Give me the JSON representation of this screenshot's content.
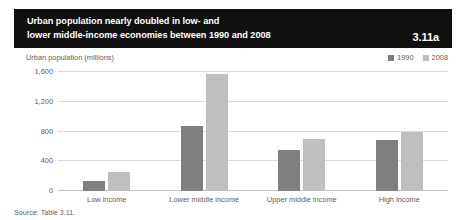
{
  "top_clip": {
    "left_fragment": "",
    "right_fragment": ""
  },
  "banner": {
    "title": "Urban population nearly doubled in low- and\nlower middle-income economies between 1990 and 2008",
    "figure_number": "3.11a",
    "background_color": "#101010",
    "text_color": "#ffffff"
  },
  "footer": {
    "source": "Source: Table 3.11."
  },
  "chart_data": {
    "type": "bar",
    "title": "Urban population nearly doubled in low- and lower middle-income economies between 1990 and 2008",
    "xlabel": "",
    "ylabel": "Urban population (millions)",
    "categories": [
      "Low income",
      "Lower middle income",
      "Upper middle income",
      "High income"
    ],
    "series": [
      {
        "name": "1990",
        "color": "#7f7f7f",
        "values": [
          135,
          870,
          545,
          680
        ]
      },
      {
        "name": "2008",
        "color": "#bfbfbf",
        "values": [
          260,
          1580,
          700,
          800
        ]
      }
    ],
    "ylim": [
      0,
      1600
    ],
    "yticks": [
      0,
      400,
      800,
      1200,
      1600
    ],
    "ytick_labels": [
      "0",
      "400",
      "800",
      "1,200",
      "1,600"
    ],
    "grid": true,
    "legend_position": "top-right"
  }
}
